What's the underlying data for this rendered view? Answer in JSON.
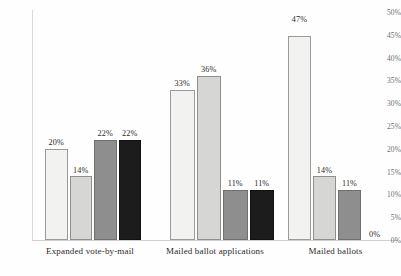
{
  "chart_data": {
    "type": "bar",
    "title": "",
    "subtitle": "",
    "xlabel": "",
    "ylabel": "",
    "ylim": [
      0,
      50
    ],
    "ytick_labels": [
      "50%",
      "45%",
      "40%",
      "35%",
      "30%",
      "25%",
      "20%",
      "15%",
      "10%",
      "5%",
      "0%"
    ],
    "ytick_values": [
      50,
      45,
      40,
      35,
      30,
      25,
      20,
      15,
      10,
      5,
      0
    ],
    "grid": false,
    "legend_position": "none",
    "value_label_suffix": "%",
    "categories": [
      "Expanded vote-by-mail",
      "Mailed ballot applications",
      "Mailed ballots"
    ],
    "series": [
      {
        "name": "series-1",
        "color": "#f2f2f0",
        "values": [
          20,
          33,
          47
        ],
        "labels": [
          "20%",
          "33%",
          "47%"
        ]
      },
      {
        "name": "series-2",
        "color": "#d6d6d4",
        "values": [
          14,
          36,
          14
        ],
        "labels": [
          "14%",
          "36%",
          "14%"
        ]
      },
      {
        "name": "series-3",
        "color": "#8e8e8e",
        "values": [
          22,
          11,
          11
        ],
        "labels": [
          "22%",
          "11%",
          "11%"
        ]
      },
      {
        "name": "series-4",
        "color": "#1c1c1c",
        "values": [
          22,
          11,
          0
        ],
        "labels": [
          "22%",
          "11%",
          "0%"
        ]
      }
    ]
  }
}
